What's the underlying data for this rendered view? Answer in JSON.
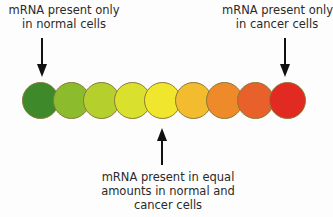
{
  "labels": {
    "normal": [
      "mRNA present only",
      "in normal cells"
    ],
    "cancer": [
      "mRNA present only",
      "in cancer cells"
    ],
    "equal": [
      "mRNA present in equal",
      "amounts in normal and",
      "cancer cells"
    ]
  },
  "circles": [
    {
      "color": "#3e8a2a"
    },
    {
      "color": "#8cbb2e"
    },
    {
      "color": "#b5cf2c"
    },
    {
      "color": "#d9e12e"
    },
    {
      "color": "#f1e62e"
    },
    {
      "color": "#f2bc2e"
    },
    {
      "color": "#ee8a2a"
    },
    {
      "color": "#e8602a"
    },
    {
      "color": "#e02a22"
    }
  ]
}
